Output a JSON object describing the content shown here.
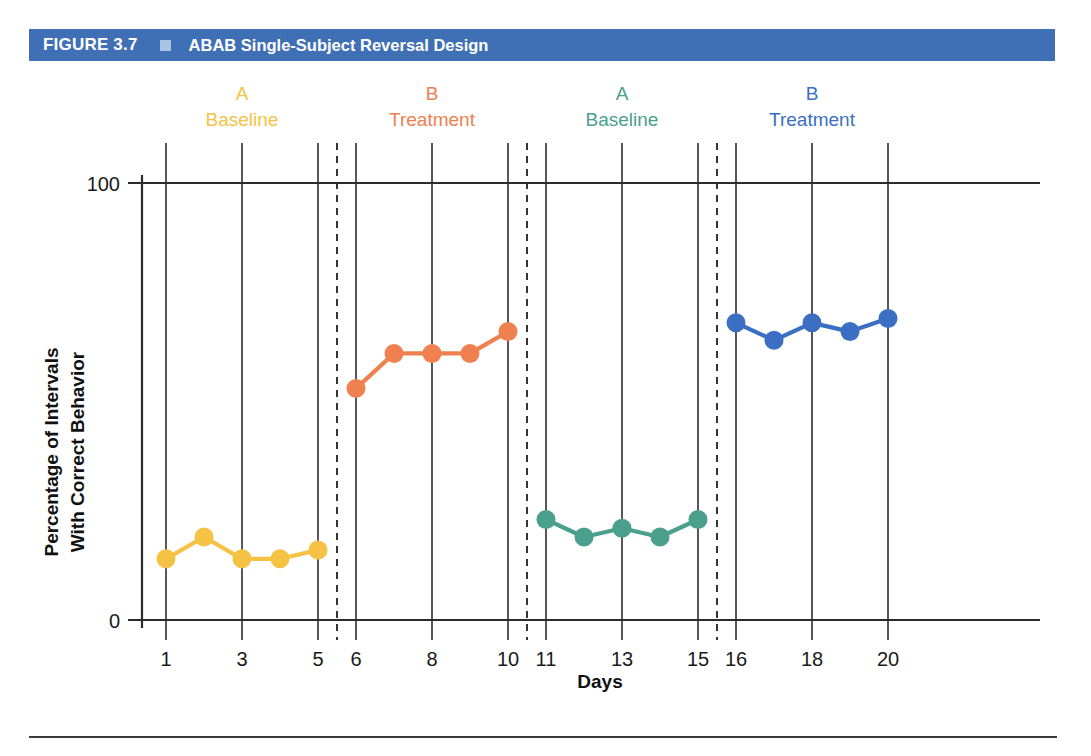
{
  "header": {
    "figure_number": "FIGURE 3.7",
    "marker_icon": "square-marker-icon",
    "title": "ABAB Single-Subject Reversal Design",
    "bar_color": "#3f6fb5",
    "marker_color": "#a9c3e2",
    "text_color": "#ffffff"
  },
  "chart_data": {
    "type": "line",
    "title": "ABAB Single-Subject Reversal Design",
    "xlabel": "Days",
    "ylabel": "Percentage of Intervals With Correct Behavior",
    "xlim": [
      0,
      21
    ],
    "ylim": [
      0,
      100
    ],
    "y_ticks": [
      "0",
      "100"
    ],
    "y_tick_values": [
      0,
      100
    ],
    "x_ticks": [
      "1",
      "3",
      "5",
      "6",
      "8",
      "10",
      "11",
      "13",
      "15",
      "16",
      "18",
      "20"
    ],
    "x_tick_values": [
      1,
      3,
      5,
      6,
      8,
      10,
      11,
      13,
      15,
      16,
      18,
      20
    ],
    "grid": "vertical-at-ticks",
    "legend": "none",
    "phase_dividers": [
      5.5,
      10.5,
      15.5
    ],
    "phases": [
      {
        "letter": "A",
        "name": "Baseline",
        "color": "#f5c243",
        "x_center": 3,
        "days": [
          1,
          2,
          3,
          4,
          5
        ]
      },
      {
        "letter": "B",
        "name": "Treatment",
        "color": "#ef8050",
        "x_center": 8,
        "days": [
          6,
          7,
          8,
          9,
          10
        ]
      },
      {
        "letter": "A",
        "name": "Baseline",
        "color": "#4aa08c",
        "x_center": 13,
        "days": [
          11,
          12,
          13,
          14,
          15
        ]
      },
      {
        "letter": "B",
        "name": "Treatment",
        "color": "#3a6fc4",
        "x_center": 18,
        "days": [
          16,
          17,
          18,
          19,
          20
        ]
      }
    ],
    "series": [
      {
        "name": "A Baseline 1",
        "color": "#f5c243",
        "x": [
          1,
          2,
          3,
          4,
          5
        ],
        "values": [
          14,
          19,
          14,
          14,
          16
        ]
      },
      {
        "name": "B Treatment 1",
        "color": "#ef8050",
        "x": [
          6,
          7,
          8,
          9,
          10
        ],
        "values": [
          53,
          61,
          61,
          61,
          66
        ]
      },
      {
        "name": "A Baseline 2",
        "color": "#4aa08c",
        "x": [
          11,
          12,
          13,
          14,
          15
        ],
        "values": [
          23,
          19,
          21,
          19,
          23
        ]
      },
      {
        "name": "B Treatment 2",
        "color": "#3a6fc4",
        "x": [
          16,
          17,
          18,
          19,
          20
        ],
        "values": [
          68,
          64,
          68,
          66,
          69
        ]
      }
    ]
  },
  "axis_style": {
    "axis_color": "#2b2b2b",
    "grid_color": "#3a3a3a",
    "divider_color": "#2b2b2b"
  }
}
